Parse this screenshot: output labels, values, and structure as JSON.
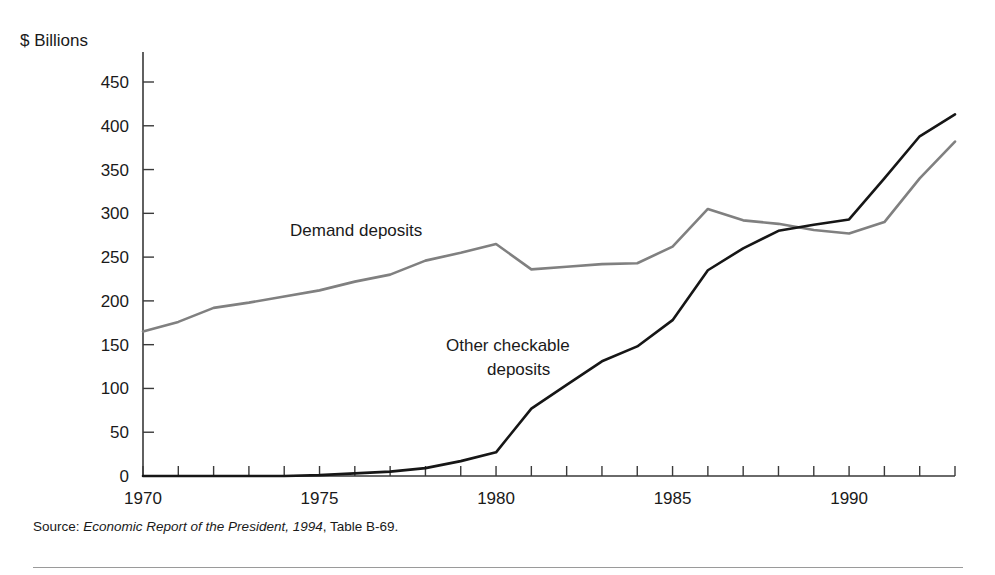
{
  "figure": {
    "y_axis_unit_label": "$ Billions",
    "source_prefix": "Source:",
    "source_italic": "Economic Report of the President, 1994",
    "source_suffix": ", Table B-69."
  },
  "chart_data": {
    "type": "line",
    "title": "",
    "xlabel": "",
    "ylabel": "$ Billions",
    "ylim": [
      0,
      450
    ],
    "xlim": [
      1970,
      1993
    ],
    "ytick_labels": [
      "450",
      "400",
      "350",
      "300",
      "250",
      "200",
      "150",
      "100",
      "50",
      "0"
    ],
    "yticks": [
      450,
      400,
      350,
      300,
      250,
      200,
      150,
      100,
      50,
      0
    ],
    "xtick_labels": [
      "1970",
      "1975",
      "1980",
      "1985",
      "1990"
    ],
    "xticks_labeled": [
      1970,
      1975,
      1980,
      1985,
      1990
    ],
    "xticks_all": [
      1970,
      1971,
      1972,
      1973,
      1974,
      1975,
      1976,
      1977,
      1978,
      1979,
      1980,
      1981,
      1982,
      1983,
      1984,
      1985,
      1986,
      1987,
      1988,
      1989,
      1990,
      1991,
      1992,
      1993
    ],
    "grid": false,
    "legend_position": "inline-annotations",
    "x": [
      1970,
      1971,
      1972,
      1973,
      1974,
      1975,
      1976,
      1977,
      1978,
      1979,
      1980,
      1981,
      1982,
      1983,
      1984,
      1985,
      1986,
      1987,
      1988,
      1989,
      1990,
      1991,
      1992,
      1993
    ],
    "series": [
      {
        "name": "Demand deposits",
        "color": "#808080",
        "label_text": "Demand deposits",
        "label_lines": [
          "Demand deposits"
        ],
        "values": [
          165,
          176,
          192,
          198,
          205,
          212,
          222,
          230,
          246,
          255,
          265,
          236,
          239,
          242,
          243,
          262,
          305,
          292,
          288,
          281,
          277,
          290,
          340,
          382
        ]
      },
      {
        "name": "Other checkable deposits",
        "color": "#161616",
        "label_text": "Other checkable deposits",
        "label_lines": [
          "Other checkable",
          "deposits"
        ],
        "values": [
          0,
          0,
          0,
          0,
          0,
          1,
          3,
          5,
          9,
          17,
          27,
          77,
          104,
          131,
          148,
          178,
          235,
          260,
          280,
          287,
          293,
          340,
          388,
          413
        ]
      }
    ],
    "annotations": [
      {
        "text": "Demand deposits",
        "x_px": 290,
        "y_px": 236
      },
      {
        "text": "Other checkable",
        "x_px": 446,
        "y_px": 351
      },
      {
        "text": "deposits",
        "x_px": 487,
        "y_px": 375
      }
    ]
  }
}
